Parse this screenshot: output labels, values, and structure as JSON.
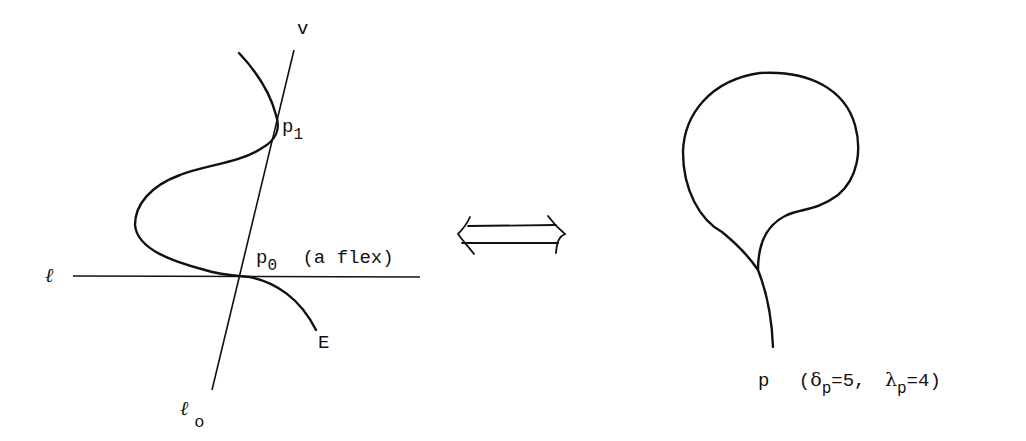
{
  "left_figure": {
    "line_l_label": "ℓ",
    "line_l0_label": "ℓ",
    "line_l0_subscript": "o",
    "line_l0_top_label": "v",
    "point_p1": {
      "base": "p",
      "sub": "1"
    },
    "point_p0": {
      "base": "p",
      "sub": "0",
      "note": "(a flex)"
    },
    "curve_label": "E"
  },
  "equivalence_arrow": {
    "symbol": "⟺"
  },
  "right_figure": {
    "point_label": "p",
    "open_paren": "(",
    "delta": {
      "symbol": "δ",
      "sub": "p",
      "value": "=5,"
    },
    "lambda": {
      "symbol": "λ",
      "sub": "p",
      "value": "=4"
    },
    "close_paren": ")"
  },
  "colors": {
    "stroke": "#111111",
    "background": "#ffffff"
  }
}
